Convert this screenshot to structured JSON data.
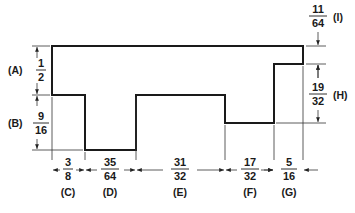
{
  "diagram": {
    "type": "dimensioned-profile",
    "units": "inches (fractional)",
    "dimensions": [
      {
        "id": "A",
        "label": "(A)",
        "num": "1",
        "den": "2",
        "orientation": "vertical",
        "side": "left"
      },
      {
        "id": "B",
        "label": "(B)",
        "num": "9",
        "den": "16",
        "orientation": "vertical",
        "side": "left"
      },
      {
        "id": "C",
        "label": "(C)",
        "num": "3",
        "den": "8",
        "orientation": "horizontal",
        "side": "bottom"
      },
      {
        "id": "D",
        "label": "(D)",
        "num": "35",
        "den": "64",
        "orientation": "horizontal",
        "side": "bottom"
      },
      {
        "id": "E",
        "label": "(E)",
        "num": "31",
        "den": "32",
        "orientation": "horizontal",
        "side": "bottom"
      },
      {
        "id": "F",
        "label": "(F)",
        "num": "17",
        "den": "32",
        "orientation": "horizontal",
        "side": "bottom"
      },
      {
        "id": "G",
        "label": "(G)",
        "num": "5",
        "den": "16",
        "orientation": "horizontal",
        "side": "bottom"
      },
      {
        "id": "H",
        "label": "(H)",
        "num": "19",
        "den": "32",
        "orientation": "vertical",
        "side": "right"
      },
      {
        "id": "I",
        "label": "(I)",
        "num": "11",
        "den": "64",
        "orientation": "vertical",
        "side": "right"
      }
    ]
  }
}
